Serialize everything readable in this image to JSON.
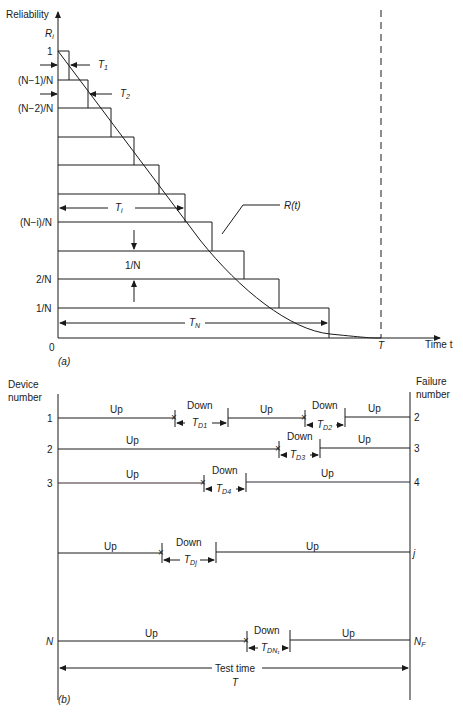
{
  "figure_a": {
    "y_axis_label": "Reliability",
    "y_axis_symbol": "R",
    "y_axis_symbol_sub": "i",
    "x_axis_label": "Time t",
    "levels": [
      "1",
      "(N−1)/N",
      "(N−2)/N",
      "(N−i)/N",
      "2/N",
      "1/N",
      "0"
    ],
    "interval_labels": {
      "t1": "T",
      "t1_sub": "1",
      "t2": "T",
      "t2_sub": "2",
      "ti": "T",
      "ti_sub": "i",
      "tn": "T",
      "tn_sub": "N"
    },
    "step_label": "1/N",
    "curve_label": "R(t)",
    "test_end_label": "T",
    "panel_label": "(a)"
  },
  "figure_b": {
    "left_header": [
      "Device",
      "number"
    ],
    "right_header": [
      "Failure",
      "number"
    ],
    "up_label": "Up",
    "down_label": "Down",
    "rows": [
      {
        "device": "1",
        "failure": "2",
        "downtimes": [
          {
            "label": "T",
            "sub": "D1"
          },
          {
            "label": "T",
            "sub": "D2"
          }
        ]
      },
      {
        "device": "2",
        "failure": "3",
        "downtimes": [
          {
            "label": "T",
            "sub": "D3"
          }
        ]
      },
      {
        "device": "3",
        "failure": "4",
        "downtimes": [
          {
            "label": "T",
            "sub": "D4"
          }
        ]
      },
      {
        "device": "",
        "failure": "j",
        "downtimes": [
          {
            "label": "T",
            "sub": "Dj"
          }
        ]
      },
      {
        "device": "N",
        "failure": "N",
        "failure_sub": "F",
        "downtimes": [
          {
            "label": "T",
            "sub": "DN₁"
          }
        ]
      }
    ],
    "test_time_label": "Test time",
    "test_time_symbol": "T",
    "panel_label": "(b)"
  }
}
